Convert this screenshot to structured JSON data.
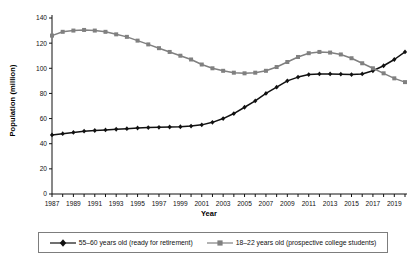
{
  "chart_data": {
    "type": "line",
    "title": "",
    "xlabel": "Year",
    "ylabel": "Population (million)",
    "xlim": [
      1987,
      2020
    ],
    "ylim": [
      0,
      140
    ],
    "ytick_step": 20,
    "xtick_step": 1,
    "xtick_label_step": 2,
    "grid": false,
    "legend_position": "bottom",
    "x": [
      1987,
      1988,
      1989,
      1990,
      1991,
      1992,
      1993,
      1994,
      1995,
      1996,
      1997,
      1998,
      1999,
      2000,
      2001,
      2002,
      2003,
      2004,
      2005,
      2006,
      2007,
      2008,
      2009,
      2010,
      2011,
      2012,
      2013,
      2014,
      2015,
      2016,
      2017,
      2018,
      2019,
      2020
    ],
    "xticklabels": [
      "1987",
      "1989",
      "1991",
      "1993",
      "1995",
      "1997",
      "1999",
      "2001",
      "2003",
      "2005",
      "2007",
      "2009",
      "2011",
      "2013",
      "2015",
      "2017",
      "2019"
    ],
    "yticklabels": [
      "0",
      "20",
      "40",
      "60",
      "80",
      "100",
      "120",
      "140"
    ],
    "series": [
      {
        "name": "55–60 years old (ready for retirement)",
        "color": "#111111",
        "marker": "diamond",
        "values": [
          47,
          48,
          49,
          50,
          50.5,
          51,
          51.5,
          52,
          52.5,
          52.8,
          53,
          53.3,
          53.5,
          54,
          55,
          57,
          60,
          64,
          69,
          74,
          80,
          85,
          90,
          93,
          95,
          95.5,
          95.5,
          95.3,
          95,
          95.5,
          98,
          102,
          107,
          113
        ]
      },
      {
        "name": "18–22 years old (prospective college students)",
        "color": "#808080",
        "marker": "square",
        "values": [
          126,
          129,
          130,
          130.5,
          130,
          129,
          127,
          125,
          122,
          119,
          116,
          113,
          110,
          107,
          103,
          100,
          98,
          96.5,
          96,
          96.5,
          98,
          101,
          105,
          109,
          112,
          113,
          112.5,
          111,
          108,
          104,
          100,
          96,
          92,
          89
        ]
      }
    ]
  },
  "legend": {
    "items": [
      {
        "label": "55–60 years old (ready for retirement)",
        "color": "#111111",
        "marker": "diamond"
      },
      {
        "label": "18–22 years old (prospective college students)",
        "color": "#808080",
        "marker": "square"
      }
    ]
  }
}
